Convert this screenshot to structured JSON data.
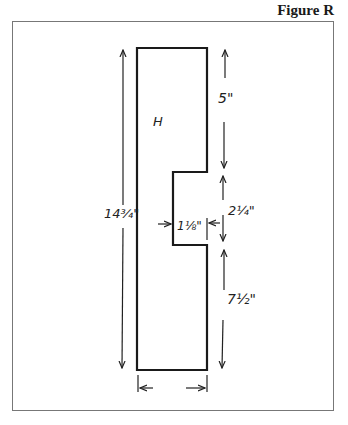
{
  "figure": {
    "title": "Figure R",
    "part_label": "H",
    "dimensions": {
      "overall_height": "14¾\"",
      "top_segment": "5\"",
      "notch_height": "2¼\"",
      "notch_depth": "1⅛\"",
      "bottom_segment": "7½\"",
      "width_arrows": ""
    },
    "colors": {
      "line": "#1a1a1a",
      "frame": "#777777",
      "background": "#ffffff"
    }
  }
}
